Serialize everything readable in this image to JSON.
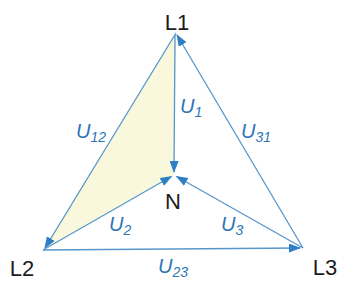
{
  "diagram": {
    "type": "three-phase-voltage-phasor-triangle",
    "colors": {
      "line": "#5796CC",
      "arrowhead": "#2E7FC6",
      "highlight_fill": "#FAF8DC",
      "vector_label": "#2E75B6",
      "node_label": "#1C1C1C",
      "background": "#FFFFFF"
    },
    "nodes": {
      "L1": {
        "label": "L1"
      },
      "L2": {
        "label": "L2"
      },
      "L3": {
        "label": "L3"
      },
      "N": {
        "label": "N"
      }
    },
    "vectors": {
      "U1": {
        "symbol": "U",
        "sub": "1",
        "from": "L1",
        "to": "N"
      },
      "U2": {
        "symbol": "U",
        "sub": "2",
        "from": "L2",
        "to": "N"
      },
      "U3": {
        "symbol": "U",
        "sub": "3",
        "from": "L3",
        "to": "N"
      },
      "U12": {
        "symbol": "U",
        "sub": "12",
        "from": "L1",
        "to": "L2"
      },
      "U23": {
        "symbol": "U",
        "sub": "23",
        "from": "L2",
        "to": "L3"
      },
      "U31": {
        "symbol": "U",
        "sub": "31",
        "from": "L3",
        "to": "L1"
      }
    }
  }
}
